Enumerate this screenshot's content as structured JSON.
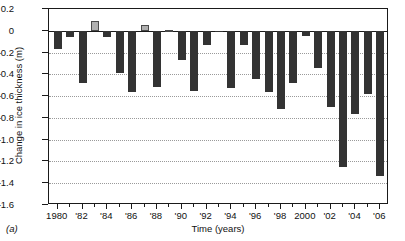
{
  "panel": {
    "label": "(a)"
  },
  "chart_data": {
    "type": "bar",
    "title": "",
    "xlabel": "Time (years)",
    "ylabel": "Change in ice thickness (m)",
    "ylim": [
      -1.6,
      0.2
    ],
    "yticks": [
      0.2,
      0,
      -0.2,
      -0.4,
      -0.6,
      -0.8,
      -1.0,
      -1.2,
      -1.4,
      -1.6
    ],
    "ytick_labels": [
      "0.2",
      "0",
      "–0.2",
      "–0.4",
      "–0.6",
      "–0.8",
      "–1.0",
      "–1.2",
      "–1.4",
      "–1.6"
    ],
    "xlim": [
      1979.3,
      2006.7
    ],
    "xticks": [
      1980,
      1982,
      1984,
      1986,
      1988,
      1990,
      1992,
      1994,
      1996,
      1998,
      2000,
      2002,
      2004,
      2006
    ],
    "xtick_labels": [
      "1980",
      "'82",
      "'84",
      "'86",
      "'88",
      "'90",
      "'92",
      "'94",
      "'96",
      "'98",
      "2000",
      "'02",
      "'04",
      "'06"
    ],
    "grid": true,
    "grid_axis": "y",
    "legend": "none",
    "colors": {
      "negative_bar": "#333333",
      "positive_bar": "#b0b0b0",
      "positive_bar_edge": "#4a4a4a",
      "axis": "#1a1a1a",
      "gridline": "#9a9a9a",
      "background": "#ffffff"
    },
    "categories": [
      1980,
      1981,
      1982,
      1983,
      1984,
      1985,
      1986,
      1987,
      1988,
      1989,
      1990,
      1991,
      1992,
      1993,
      1994,
      1995,
      1996,
      1997,
      1998,
      1999,
      2000,
      2001,
      2002,
      2003,
      2004,
      2005,
      2006
    ],
    "values": [
      -0.17,
      -0.06,
      -0.48,
      0.09,
      -0.06,
      -0.39,
      -0.56,
      0.05,
      -0.52,
      0.01,
      -0.27,
      -0.55,
      -0.13,
      -0.01,
      -0.53,
      -0.13,
      -0.44,
      -0.56,
      -0.72,
      -0.48,
      -0.05,
      -0.34,
      -0.7,
      -1.25,
      -0.76,
      -0.58,
      -1.33
    ]
  }
}
